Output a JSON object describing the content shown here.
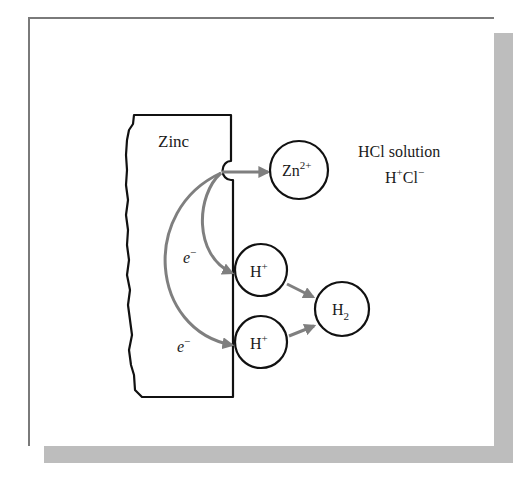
{
  "diagram": {
    "metal_label": "Zinc",
    "solution_label": "HCl solution",
    "solution_ions": {
      "h": "H",
      "h_charge": "+",
      "cl": "Cl",
      "cl_charge": "−"
    },
    "species": {
      "zinc_ion": {
        "base": "Zn",
        "charge": "2+"
      },
      "proton_top": {
        "base": "H",
        "charge": "+"
      },
      "proton_bottom": {
        "base": "H",
        "charge": "+"
      },
      "hydrogen": {
        "base": "H",
        "subscript": "2"
      }
    },
    "electron_labels": [
      {
        "base": "e",
        "charge": "−"
      },
      {
        "base": "e",
        "charge": "−"
      }
    ],
    "colors": {
      "outline": "#111111",
      "arrow": "#7f7f7f",
      "panel_border": "#7a7a7a",
      "shadow": "#bdbdbd"
    }
  }
}
